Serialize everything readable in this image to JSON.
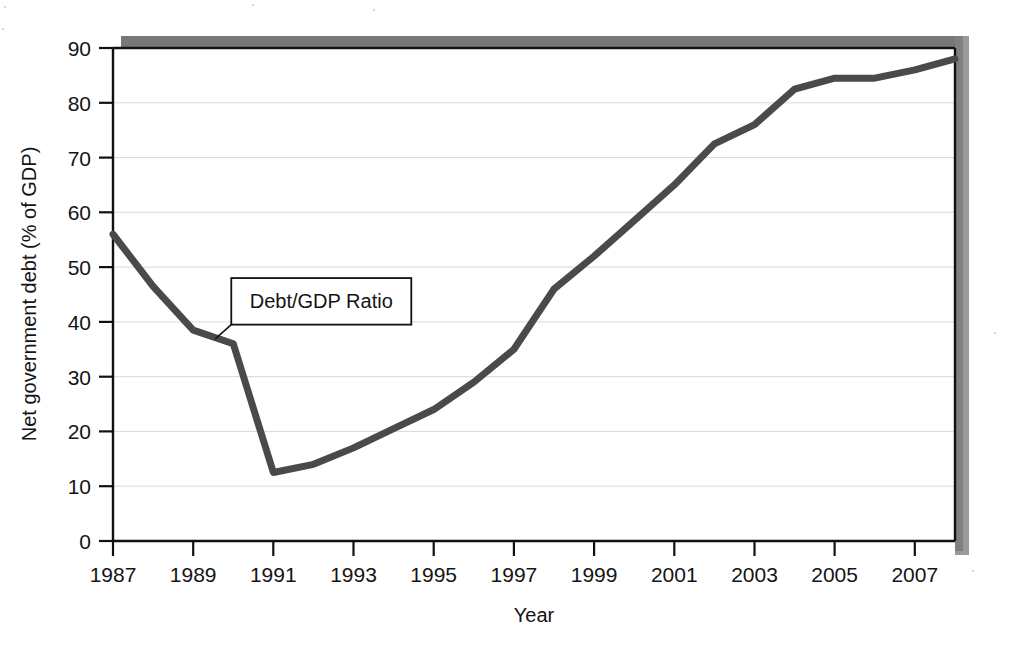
{
  "chart_data": {
    "type": "line",
    "title": "",
    "subtitle": "",
    "xlabel": "Year",
    "ylabel": "Net government debt (% of GDP)",
    "xlim": [
      1987,
      2008
    ],
    "ylim": [
      0,
      90
    ],
    "grid": "horizontal",
    "legend_position": "none",
    "x_tick_labels": [
      "1987",
      "1989",
      "1991",
      "1993",
      "1995",
      "1997",
      "1999",
      "2001",
      "2003",
      "2005",
      "2007"
    ],
    "x_tick_values": [
      1987,
      1989,
      1991,
      1993,
      1995,
      1997,
      1999,
      2001,
      2003,
      2005,
      2007
    ],
    "x_minor_ticks": [
      1988,
      1990,
      1992,
      1994,
      1996,
      1998,
      2000,
      2002,
      2004,
      2006,
      2008
    ],
    "y_tick_labels": [
      "0",
      "10",
      "20",
      "30",
      "40",
      "50",
      "60",
      "70",
      "80",
      "90"
    ],
    "y_tick_values": [
      0,
      10,
      20,
      30,
      40,
      50,
      60,
      70,
      80,
      90
    ],
    "series": [
      {
        "name": "Debt/GDP Ratio",
        "color": "#4a4a4a",
        "x": [
          1987,
          1988,
          1989,
          1990,
          1991,
          1992,
          1993,
          1994,
          1995,
          1996,
          1997,
          1998,
          1999,
          2000,
          2001,
          2002,
          2003,
          2004,
          2005,
          2006,
          2007,
          2008
        ],
        "values": [
          56.0,
          46.5,
          38.5,
          36.0,
          12.5,
          14.0,
          17.0,
          20.5,
          24.0,
          29.0,
          35.0,
          46.0,
          52.0,
          58.5,
          65.0,
          72.5,
          76.0,
          82.5,
          84.5,
          84.5,
          86.0,
          88.0
        ]
      }
    ],
    "annotations": [
      {
        "text": "Debt/GDP Ratio",
        "box_x": 1989.95,
        "box_y_top": 48.0,
        "box_y_bottom": 39.5,
        "anchor_x": 1989.55,
        "anchor_y": 36.9
      }
    ]
  },
  "axis": {
    "x_title": "Year",
    "y_title": "Net government debt (% of GDP)"
  },
  "colors": {
    "line": "#4a4a4a",
    "frame": "#111111",
    "grid": "#d8d8d8",
    "shadow": "#787878",
    "background": "#ffffff"
  }
}
